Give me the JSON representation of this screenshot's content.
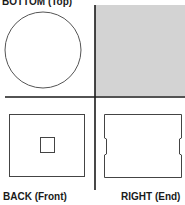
{
  "labels": {
    "top_left": "BOTTOM (Top)",
    "bottom_left": "BACK (Front)",
    "bottom_right": "RIGHT (End)"
  },
  "colors": {
    "line": "#1a1a1a",
    "shape_stroke": "#555555",
    "shaded_fill": "#d3d3d3",
    "background": "#ffffff"
  },
  "views": [
    {
      "name": "BOTTOM (Top)",
      "shape": "circle"
    },
    {
      "name": "shaded quadrant",
      "shape": "filled-square"
    },
    {
      "name": "BACK (Front)",
      "shape": "rectangle-with-inner-square"
    },
    {
      "name": "RIGHT (End)",
      "shape": "rectangle-with-side-notches"
    }
  ]
}
